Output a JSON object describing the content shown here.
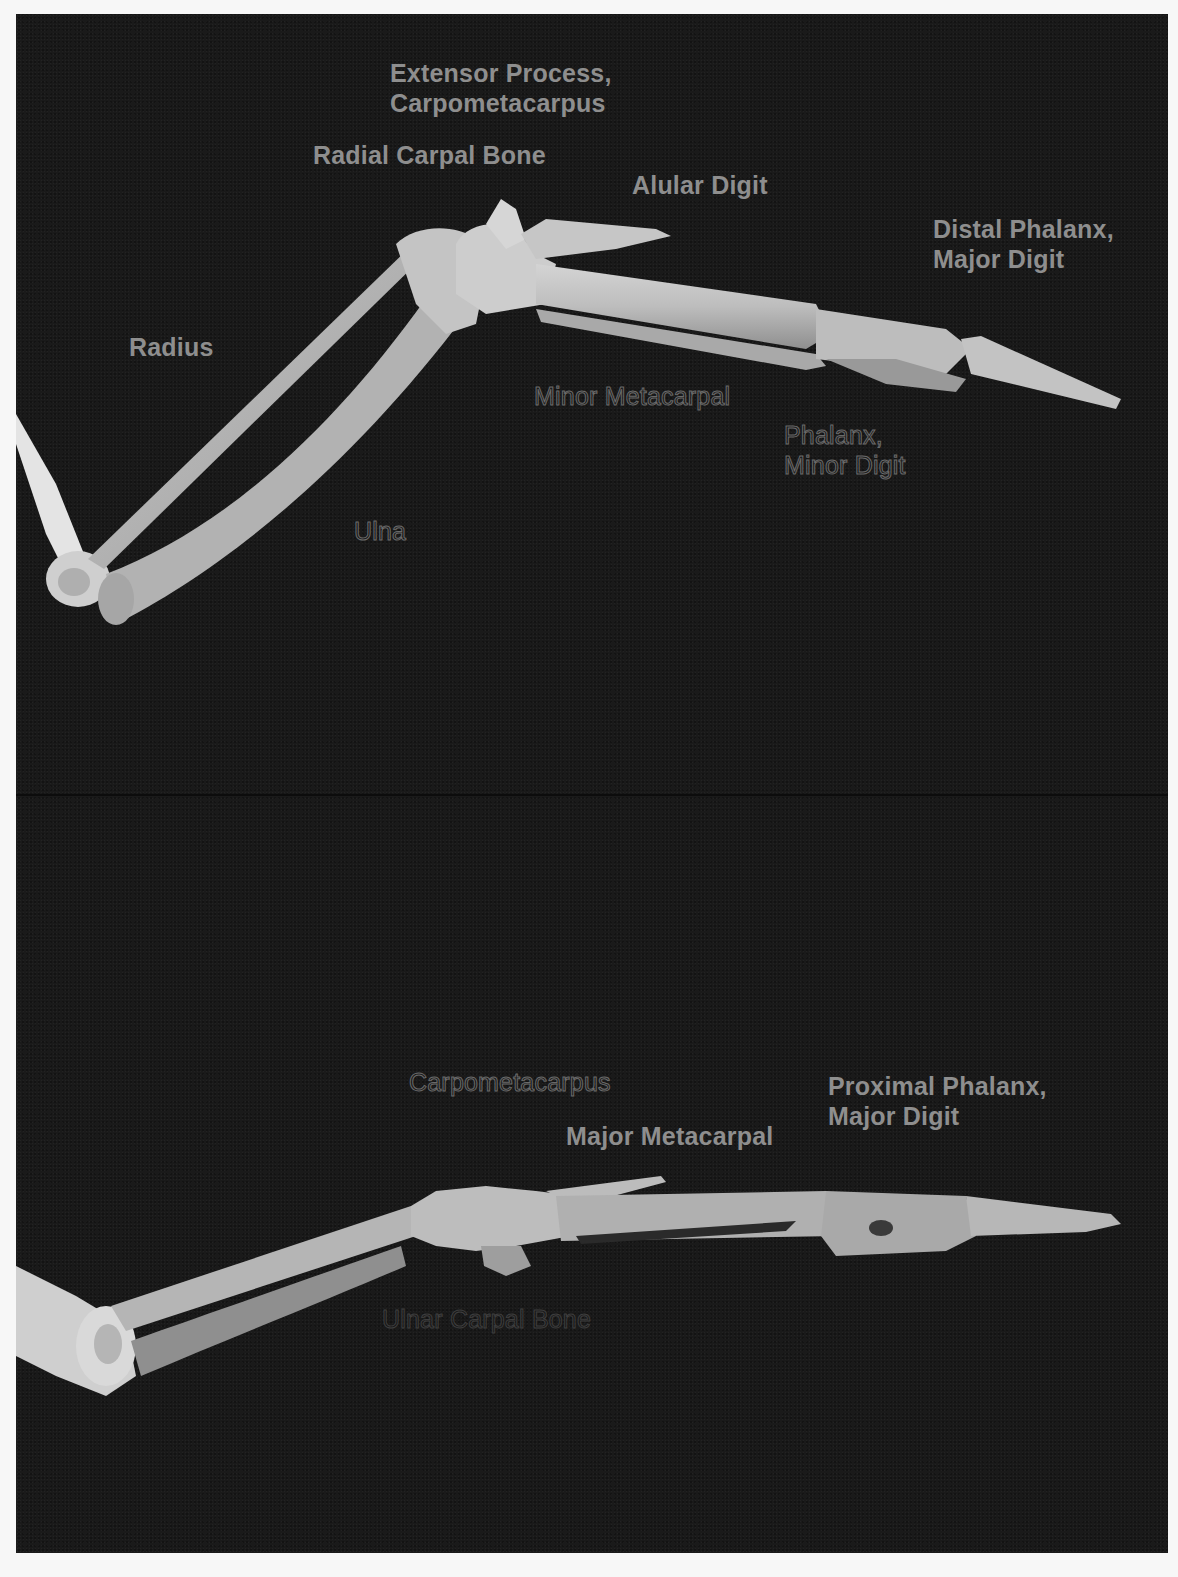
{
  "figure": {
    "background_color": "#1a1a1a",
    "label_color": "#8e8e8e",
    "panels": [
      {
        "id": "top",
        "labels": {
          "extensor_process": [
            "Extensor Process,",
            "Carpometacarpus"
          ],
          "radial_carpal": "Radial Carpal Bone",
          "alular_digit": "Alular Digit",
          "distal_phalanx": [
            "Distal Phalanx,",
            "Major Digit"
          ],
          "radius": "Radius",
          "minor_metacarpal": "Minor Metacarpal",
          "phalanx_minor": [
            "Phalanx,",
            "Minor Digit"
          ],
          "ulna": "Ulna"
        }
      },
      {
        "id": "bottom",
        "labels": {
          "carpometacarpus": "Carpometacarpus",
          "major_metacarpal": "Major Metacarpal",
          "proximal_phalanx": [
            "Proximal Phalanx,",
            "Major Digit"
          ],
          "ulnar_carpal": "Ulnar Carpal Bone"
        }
      }
    ]
  }
}
